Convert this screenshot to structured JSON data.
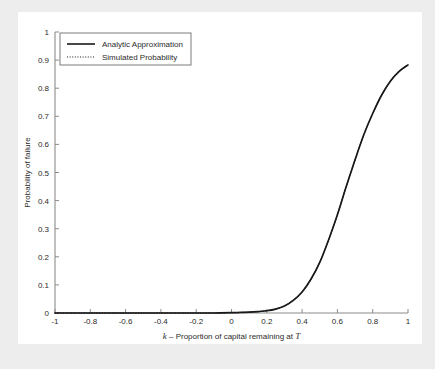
{
  "figure": {
    "background_color": "#ededed",
    "panel_color": "#ffffff",
    "axis_color": "#8c8c8c",
    "text_color": "#2b2b2b",
    "curve_color": "#1a1a1a"
  },
  "chart_data": {
    "type": "line",
    "title": "",
    "subtitle": "",
    "xlabel_parts": {
      "symbol": "k",
      "dash": " – ",
      "text": "Proportion of capital remaining at ",
      "symbol_end": "T"
    },
    "xlabel": "k – Proportion of capital remaining at T",
    "ylabel": "Probability of failure",
    "xlim": [
      -1,
      1
    ],
    "ylim": [
      0,
      1
    ],
    "grid": false,
    "legend_position": "upper left",
    "xticks": [
      -1,
      -0.8,
      -0.6,
      -0.4,
      -0.2,
      0,
      0.2,
      0.4,
      0.6,
      0.8,
      1
    ],
    "xticklabels": [
      "-1",
      "-0.8",
      "-0.6",
      "-0.4",
      "-0.2",
      "0",
      "0.2",
      "0.4",
      "0.6",
      "0.8",
      "1"
    ],
    "yticks": [
      0,
      0.1,
      0.2,
      0.3,
      0.4,
      0.5,
      0.6,
      0.7,
      0.8,
      0.9,
      1
    ],
    "yticklabels": [
      "0",
      "0.1",
      "0.2",
      "0.3",
      "0.4",
      "0.5",
      "0.6",
      "0.7",
      "0.8",
      "0.9",
      "1"
    ],
    "series": [
      {
        "name": "Analytic Approximation",
        "style": "solid",
        "color": "#1a1a1a",
        "x": [
          -1,
          -0.9,
          -0.8,
          -0.7,
          -0.6,
          -0.5,
          -0.4,
          -0.3,
          -0.2,
          -0.1,
          0,
          0.05,
          0.1,
          0.15,
          0.2,
          0.25,
          0.3,
          0.35,
          0.4,
          0.45,
          0.5,
          0.55,
          0.6,
          0.65,
          0.7,
          0.75,
          0.8,
          0.85,
          0.9,
          0.95,
          1
        ],
        "values": [
          0,
          0,
          0,
          0,
          0,
          0,
          0,
          0,
          0,
          0,
          0.001,
          0.002,
          0.003,
          0.005,
          0.008,
          0.014,
          0.025,
          0.045,
          0.075,
          0.12,
          0.18,
          0.26,
          0.35,
          0.45,
          0.545,
          0.635,
          0.71,
          0.775,
          0.825,
          0.86,
          0.883
        ]
      },
      {
        "name": "Simulated Probability",
        "style": "dotted",
        "color": "#1a1a1a",
        "x": [
          -1,
          -0.9,
          -0.8,
          -0.7,
          -0.6,
          -0.5,
          -0.4,
          -0.3,
          -0.2,
          -0.1,
          0,
          0.05,
          0.1,
          0.15,
          0.2,
          0.25,
          0.3,
          0.35,
          0.4,
          0.45,
          0.5,
          0.55,
          0.6,
          0.65,
          0.7,
          0.75,
          0.8,
          0.85,
          0.9,
          0.95,
          1
        ],
        "values": [
          0,
          0,
          0,
          0,
          0,
          0,
          0,
          0,
          0,
          0,
          0.001,
          0.002,
          0.003,
          0.005,
          0.008,
          0.014,
          0.025,
          0.045,
          0.075,
          0.12,
          0.18,
          0.26,
          0.35,
          0.45,
          0.545,
          0.635,
          0.71,
          0.775,
          0.825,
          0.86,
          0.883
        ]
      }
    ],
    "legend": [
      {
        "label": "Analytic Approximation",
        "style": "solid"
      },
      {
        "label": "Simulated Probability",
        "style": "dotted"
      }
    ]
  }
}
